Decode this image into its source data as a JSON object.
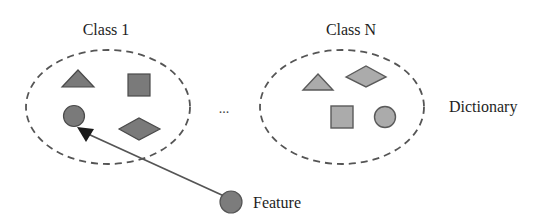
{
  "diagram": {
    "title": "",
    "classes": [
      {
        "label": "Class 1",
        "shapes": [
          "triangle",
          "square",
          "circle",
          "diamond"
        ],
        "fill": "#7a7a7a"
      },
      {
        "label": "Class N",
        "shapes": [
          "triangle",
          "diamond",
          "square",
          "circle"
        ],
        "fill": "#ababab"
      }
    ],
    "ellipsis": "...",
    "group_label": "Dictionary",
    "feature": {
      "label": "Feature",
      "fill": "#7c7c7c",
      "points_to": "Class 1 circle"
    },
    "colors": {
      "dark_shape": "#7a7a7a",
      "light_shape": "#ababab",
      "dashed_border": "#555555",
      "arrow_head": "#1a1a1a",
      "text": "#1e1e1e"
    }
  }
}
